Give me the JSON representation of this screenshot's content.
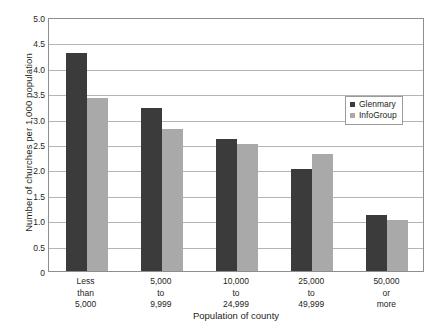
{
  "chart_data": {
    "type": "bar",
    "title": "",
    "xlabel": "Population of county",
    "ylabel": "Number of churches per 1,000 population",
    "categories": [
      "Less\nthan\n5,000",
      "5,000\nto\n9,999",
      "10,000\nto\n24,999",
      "25,000\nto\n49,999",
      "50,000\nor\nmore"
    ],
    "series": [
      {
        "name": "Glenmary",
        "color": "#3b3b3b",
        "values": [
          4.3,
          3.2,
          2.6,
          2.0,
          1.1
        ]
      },
      {
        "name": "InfoGroup",
        "color": "#a9a9a9",
        "values": [
          3.4,
          2.8,
          2.5,
          2.3,
          1.0
        ]
      }
    ],
    "ylim": [
      0,
      5.0
    ],
    "yticks": [
      "0",
      "0.5",
      "1.0",
      "1.5",
      "2.0",
      "2.5",
      "3.0",
      "3.5",
      "4.0",
      "4.5",
      "5.0"
    ],
    "ytick_values": [
      0,
      0.5,
      1.0,
      1.5,
      2.0,
      2.5,
      3.0,
      3.5,
      4.0,
      4.5,
      5.0
    ],
    "grid": true,
    "legend_position": "upper right"
  }
}
